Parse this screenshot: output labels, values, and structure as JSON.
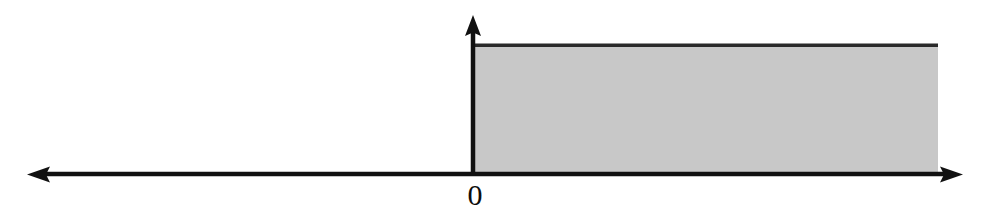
{
  "figure": {
    "title": "",
    "background_color": "#ffffff",
    "axis_color": "#111111",
    "region_fill_color": "#c8c8c8",
    "region_border_color": "#2a2a2a",
    "origin_label": "0",
    "x_axis": {
      "name": "horizontal-axis",
      "arrow_left": true,
      "arrow_right": true,
      "tick_labels": [
        "0"
      ]
    },
    "y_axis": {
      "name": "vertical-axis",
      "arrow_up": true,
      "tick_labels": []
    }
  },
  "chart_data": {
    "type": "area",
    "title": "",
    "subtitle": "",
    "xlabel": "",
    "ylabel": "",
    "xlim": [
      -4.2,
      4.9
    ],
    "ylim": [
      0,
      1.3
    ],
    "grid": false,
    "legend_position": "none",
    "xticks": [
      0
    ],
    "xticklabels": [
      "0"
    ],
    "yticks": [],
    "yticklabels": [],
    "series": [
      {
        "name": "shaded-region",
        "kind": "step-area",
        "fill": "#c8c8c8",
        "edge": "#2a2a2a",
        "x": [
          0,
          4.9
        ],
        "y": [
          1,
          1
        ],
        "baseline": 0,
        "description": "constant-height shaded band from x = 0 extending to the right edge"
      }
    ],
    "annotations": [
      {
        "text": "0",
        "x": 0,
        "y": 0,
        "position": "below-axis"
      }
    ]
  }
}
